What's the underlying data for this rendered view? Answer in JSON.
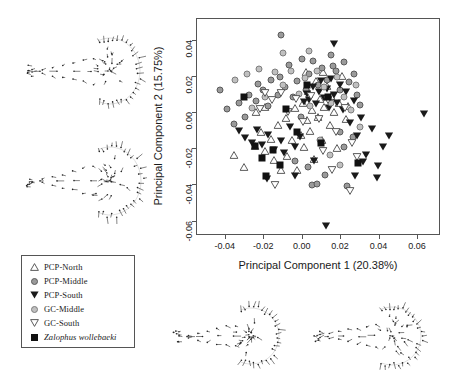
{
  "figure": {
    "type": "pca-scatter-with-deformation-grids"
  },
  "axes": {
    "x_title": "Principal Component 1 (20.38%)",
    "y_title": "Principal Component 2 (15.75%)",
    "x_ticks": [
      "-0.04",
      "-0.02",
      "0.00",
      "0.02",
      "0.04",
      "0.06"
    ],
    "y_ticks": [
      "0.04",
      "0.02",
      "0.00",
      "-0.02",
      "-0.04",
      "-0.06"
    ],
    "x_range": [
      -0.055,
      0.072
    ],
    "y_range": [
      -0.068,
      0.052
    ]
  },
  "legend": {
    "items": [
      {
        "label": "PCP-North",
        "symbol": "open-triangle-up-icon",
        "italic": false
      },
      {
        "label": "PCP-Middle",
        "symbol": "filled-circle-gray-icon",
        "italic": false
      },
      {
        "label": "PCP-South",
        "symbol": "filled-triangle-down-icon",
        "italic": false
      },
      {
        "label": "GC-Middle",
        "symbol": "filled-circle-light-gray-icon",
        "italic": false
      },
      {
        "label": "GC-South",
        "symbol": "open-triangle-down-icon",
        "italic": false
      },
      {
        "label": "Zalophus wollebaeki",
        "symbol": "filled-square-icon",
        "italic": true
      }
    ]
  },
  "chart_data": {
    "type": "scatter",
    "title": "",
    "xlabel": "Principal Component 1 (20.38%)",
    "ylabel": "Principal Component 2 (15.75%)",
    "xlim": [
      -0.055,
      0.072
    ],
    "ylim": [
      -0.068,
      0.052
    ],
    "grid": false,
    "legend_position": "outside-bottom-left",
    "series": [
      {
        "name": "PCP-North",
        "symbol": "open-triangle-up",
        "points": [
          [
            -0.0355,
            -0.0225
          ],
          [
            -0.0305,
            -0.0295
          ],
          [
            -0.025,
            -0.0175
          ],
          [
            -0.0215,
            -0.01
          ],
          [
            -0.0195,
            -0.0205
          ],
          [
            -0.0165,
            -0.014
          ],
          [
            -0.015,
            -0.0255
          ],
          [
            -0.013,
            -0.006
          ],
          [
            -0.0115,
            -0.031
          ],
          [
            -0.0085,
            -0.002
          ],
          [
            -0.008,
            -0.023
          ],
          [
            -0.0055,
            -0.0145
          ],
          [
            -0.004,
            0.0035
          ],
          [
            -0.003,
            -0.031
          ],
          [
            -0.001,
            -0.0115
          ],
          [
            0.0,
            0.006
          ],
          [
            0.0005,
            -0.018
          ],
          [
            0.002,
            -0.0035
          ],
          [
            0.003,
            0.013
          ],
          [
            0.004,
            -0.0095
          ],
          [
            0.005,
            0.0025
          ],
          [
            0.006,
            -0.025
          ],
          [
            0.007,
            0.0185
          ],
          [
            0.008,
            -0.0015
          ],
          [
            0.009,
            0.0085
          ],
          [
            0.01,
            -0.0145
          ],
          [
            0.011,
            0.004
          ],
          [
            0.0125,
            0.0155
          ],
          [
            0.014,
            -0.006
          ],
          [
            0.015,
            0.01
          ],
          [
            0.0165,
            0.001
          ],
          [
            0.018,
            -0.019
          ],
          [
            0.019,
            0.006
          ],
          [
            0.0205,
            0.021
          ],
          [
            0.0225,
            -0.0025
          ],
          [
            0.0015,
            0.023
          ],
          [
            0.0235,
            0.0045
          ],
          [
            -0.0245,
            0.001
          ],
          [
            -0.0195,
            0.004
          ],
          [
            0.0105,
            0.0235
          ]
        ]
      },
      {
        "name": "PCP-Middle",
        "symbol": "filled-circle-gray",
        "points": [
          [
            -0.043,
            0.013
          ],
          [
            -0.0395,
            0.002
          ],
          [
            -0.036,
            -0.006
          ],
          [
            -0.033,
            0.0055
          ],
          [
            -0.03,
            -0.002
          ],
          [
            -0.028,
            0.01
          ],
          [
            -0.0245,
            0.0065
          ],
          [
            -0.023,
            0.016
          ],
          [
            -0.0205,
            0.0125
          ],
          [
            -0.018,
            0.004
          ],
          [
            -0.0165,
            0.018
          ],
          [
            -0.013,
            0.01
          ],
          [
            -0.012,
            0.02
          ],
          [
            -0.009,
            0.0145
          ],
          [
            -0.007,
            0.0265
          ],
          [
            -0.005,
            0.009
          ],
          [
            -0.003,
            0.0175
          ],
          [
            -0.0005,
            0.03
          ],
          [
            0.0015,
            0.0125
          ],
          [
            0.0035,
            0.0215
          ],
          [
            0.0055,
            0.029
          ],
          [
            0.008,
            0.0155
          ],
          [
            0.01,
            0.025
          ],
          [
            0.0125,
            0.0185
          ],
          [
            0.015,
            0.032
          ],
          [
            0.0175,
            0.023
          ],
          [
            0.0195,
            0.013
          ],
          [
            0.0215,
            0.028
          ],
          [
            0.024,
            0.017
          ],
          [
            0.0265,
            0.0215
          ],
          [
            0.0285,
            0.01
          ],
          [
            0.03,
            0.0045
          ],
          [
            -0.0115,
            0.043
          ],
          [
            0.016,
            0.026
          ],
          [
            0.005,
            -0.04
          ],
          [
            0.0075,
            -0.0395
          ],
          [
            0.023,
            -0.0405
          ],
          [
            -0.001,
            -0.002
          ],
          [
            0.0195,
            -0.0105
          ],
          [
            0.0215,
            -0.019
          ],
          [
            0.026,
            -0.013
          ],
          [
            0.0115,
            -0.0345
          ],
          [
            -0.004,
            -0.0265
          ],
          [
            0.003,
            -0.03
          ]
        ]
      },
      {
        "name": "PCP-South",
        "symbol": "filled-triangle-down",
        "points": [
          [
            -0.033,
            -0.0095
          ],
          [
            -0.03,
            -0.013
          ],
          [
            -0.0265,
            -0.016
          ],
          [
            -0.024,
            -0.009
          ],
          [
            -0.021,
            -0.017
          ],
          [
            -0.018,
            -0.0115
          ],
          [
            -0.015,
            -0.02
          ],
          [
            -0.0115,
            -0.015
          ],
          [
            -0.0095,
            -0.0215
          ],
          [
            -0.0065,
            -0.007
          ],
          [
            -0.004,
            -0.0185
          ],
          [
            -0.0015,
            -0.0125
          ],
          [
            0.0005,
            0.0065
          ],
          [
            0.002,
            0.011
          ],
          [
            0.0035,
            0.008
          ],
          [
            0.0055,
            0.015
          ],
          [
            0.007,
            0.0055
          ],
          [
            0.0085,
            0.012
          ],
          [
            0.0095,
            0.018
          ],
          [
            0.011,
            0.009
          ],
          [
            0.0125,
            0.014
          ],
          [
            0.0135,
            0.0035
          ],
          [
            0.015,
            0.0195
          ],
          [
            0.0165,
            0.0105
          ],
          [
            0.018,
            0.006
          ],
          [
            0.0195,
            0.016
          ],
          [
            0.021,
            0.002
          ],
          [
            0.0225,
            0.012
          ],
          [
            0.0245,
            -0.005
          ],
          [
            0.0265,
            0.007
          ],
          [
            0.0285,
            -0.012
          ],
          [
            0.0305,
            -0.002
          ],
          [
            0.033,
            -0.0225
          ],
          [
            0.036,
            -0.008
          ],
          [
            0.039,
            -0.029
          ],
          [
            0.042,
            -0.018
          ],
          [
            0.045,
            -0.012
          ],
          [
            0.063,
            0.0
          ],
          [
            0.012,
            -0.062
          ],
          [
            0.0165,
            0.039
          ],
          [
            -0.0185,
            -0.036
          ],
          [
            0.006,
            -0.026
          ],
          [
            0.027,
            -0.034
          ],
          [
            0.0315,
            -0.0265
          ],
          [
            0.0385,
            -0.0355
          ],
          [
            -0.004,
            -0.0345
          ]
        ]
      },
      {
        "name": "GC-Middle",
        "symbol": "filled-circle-light-gray",
        "points": [
          [
            -0.035,
            0.0185
          ],
          [
            -0.029,
            0.0215
          ],
          [
            -0.0265,
            0.003
          ],
          [
            -0.0225,
            0.0245
          ],
          [
            -0.0195,
            0.009
          ],
          [
            -0.0145,
            0.0225
          ],
          [
            -0.01,
            0.0155
          ],
          [
            -0.006,
            0.023
          ],
          [
            -0.002,
            0.0105
          ],
          [
            0.001,
            0.0195
          ],
          [
            0.004,
            0.004
          ],
          [
            0.0075,
            0.023
          ],
          [
            0.011,
            0.0145
          ],
          [
            0.0145,
            0.0055
          ],
          [
            0.018,
            0.02
          ],
          [
            0.0215,
            0.009
          ],
          [
            0.025,
            0.0015
          ],
          [
            0.028,
            0.0155
          ],
          [
            0.03,
            -0.0075
          ],
          [
            -0.01,
            0.033
          ],
          [
            0.0035,
            0.0345
          ],
          [
            0.014,
            -0.023
          ],
          [
            0.009,
            -0.015
          ],
          [
            0.0195,
            -0.029
          ]
        ]
      },
      {
        "name": "GC-South",
        "symbol": "open-triangle-down",
        "points": [
          [
            -0.022,
            0.003
          ],
          [
            -0.016,
            0.0075
          ],
          [
            -0.0115,
            0.0115
          ],
          [
            -0.0075,
            0.001
          ],
          [
            -0.0035,
            0.0085
          ],
          [
            0.0,
            -0.0045
          ],
          [
            0.0045,
            0.01
          ],
          [
            0.0085,
            -0.003
          ],
          [
            0.013,
            0.0075
          ],
          [
            0.0175,
            -0.01
          ],
          [
            0.022,
            0.0035
          ],
          [
            0.0255,
            -0.016
          ],
          [
            0.0285,
            -0.024
          ],
          [
            -0.0145,
            -0.0395
          ],
          [
            0.0245,
            -0.0425
          ],
          [
            0.0105,
            -0.0205
          ],
          [
            -0.0195,
            0.0115
          ],
          [
            0.0155,
            -0.031
          ]
        ]
      },
      {
        "name": "Zalophus wollebaeki",
        "symbol": "filled-square",
        "points": [
          [
            -0.0305,
            0.009
          ],
          [
            -0.025,
            -0.0185
          ],
          [
            -0.021,
            -0.025
          ],
          [
            -0.019,
            -0.035
          ],
          [
            -0.0155,
            -0.0205
          ],
          [
            -0.0085,
            0.0025
          ],
          [
            -0.003,
            -0.0105
          ],
          [
            0.002,
            0.0155
          ],
          [
            0.0095,
            -0.0165
          ],
          [
            0.013,
            0.009
          ],
          [
            0.029,
            -0.0275
          ],
          [
            -0.012,
            -0.029
          ]
        ]
      }
    ]
  },
  "deformation_panels": [
    {
      "name": "top-left-landmark-grid",
      "position": "top-left"
    },
    {
      "name": "bottom-left-landmark-grid",
      "position": "middle-left"
    },
    {
      "name": "bottom-center-landmark-grid",
      "position": "bottom-center"
    },
    {
      "name": "bottom-right-landmark-grid",
      "position": "bottom-right"
    }
  ]
}
